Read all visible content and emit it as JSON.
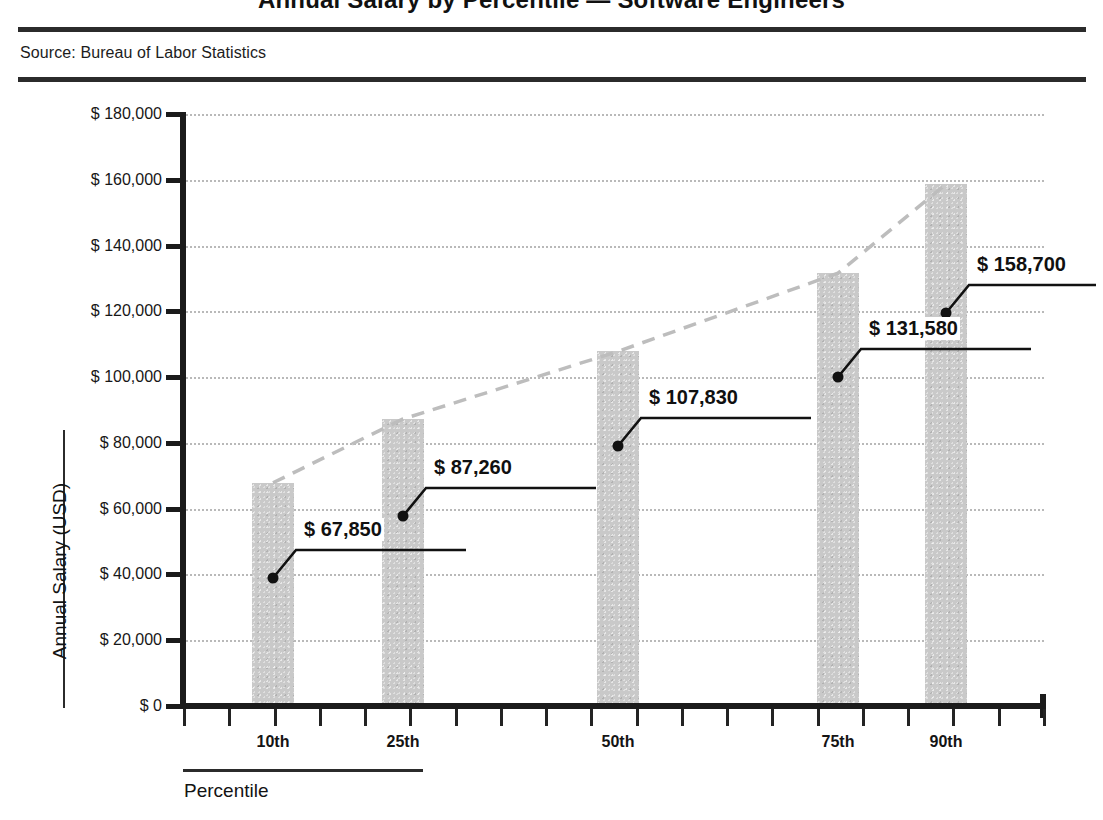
{
  "header": {
    "title": "Annual Salary by Percentile — Software Engineers",
    "source": "Source: Bureau of Labor Statistics"
  },
  "axes": {
    "y_title": "Annual Salary (USD)",
    "x_title": "Percentile",
    "y_ticks": [
      "$ 0",
      "$ 20,000",
      "$ 40,000",
      "$ 60,000",
      "$ 80,000",
      "$ 100,000",
      "$ 120,000",
      "$ 140,000",
      "$ 160,000",
      "$ 180,000"
    ],
    "x_ticks": [
      "10th",
      "25th",
      "50th",
      "75th",
      "90th"
    ]
  },
  "colors": {
    "bar_fill": "#c9c9c9",
    "axis": "#1b1b1b",
    "gridline": "#b9b9b9",
    "trendline": "#bdbdbd",
    "label_text": "#101010"
  },
  "data_labels": [
    "$ 67,850",
    "$ 87,260",
    "$ 107,830",
    "$ 131,580",
    "$ 158,700"
  ],
  "chart_data": {
    "type": "bar",
    "title": "Annual Salary by Percentile — Software Engineers",
    "subtitle": "Source: Bureau of Labor Statistics",
    "categories": [
      "10th",
      "25th",
      "50th",
      "75th",
      "90th"
    ],
    "values": [
      67850,
      87260,
      107830,
      131580,
      158700
    ],
    "value_labels": [
      "$ 67,850",
      "$ 87,260",
      "$ 107,830",
      "$ 131,580",
      "$ 158,700"
    ],
    "xlabel": "Percentile",
    "ylabel": "Annual Salary (USD)",
    "ylim": [
      0,
      180000
    ],
    "ytick_step": 20000,
    "grid": true,
    "legend": "none",
    "series": [
      {
        "name": "Annual Salary (USD)",
        "type": "bar",
        "values": [
          67850,
          87260,
          107830,
          131580,
          158700
        ]
      },
      {
        "name": "Trend",
        "type": "line",
        "style": "dashed",
        "values": [
          67850,
          87260,
          107830,
          131580,
          158700
        ]
      }
    ]
  }
}
